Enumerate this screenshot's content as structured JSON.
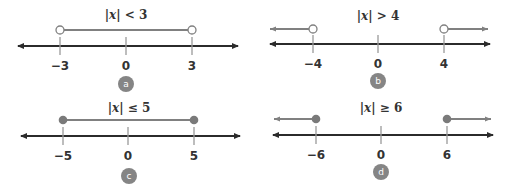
{
  "colors": {
    "axis": "#2b2b2b",
    "interval": "#808080",
    "tick": "#9a9a9a",
    "dot": "#7a7a7a",
    "badge": "#858585",
    "text": "#333333"
  },
  "panels": [
    {
      "id": "a",
      "badge": "a",
      "title_prefix": "|x|",
      "title_relation": "< 3",
      "ticks": [
        "−3",
        "0",
        "3"
      ],
      "endpoint_style": "open",
      "region": "between"
    },
    {
      "id": "b",
      "badge": "b",
      "title_prefix": "|x|",
      "title_relation": "> 4",
      "ticks": [
        "−4",
        "0",
        "4"
      ],
      "endpoint_style": "open",
      "region": "outside"
    },
    {
      "id": "c",
      "badge": "c",
      "title_prefix": "|x|",
      "title_relation": "≤ 5",
      "ticks": [
        "−5",
        "0",
        "5"
      ],
      "endpoint_style": "closed",
      "region": "between"
    },
    {
      "id": "d",
      "badge": "d",
      "title_prefix": "|x|",
      "title_relation": "≥ 6",
      "ticks": [
        "−6",
        "0",
        "6"
      ],
      "endpoint_style": "closed",
      "region": "outside"
    }
  ]
}
